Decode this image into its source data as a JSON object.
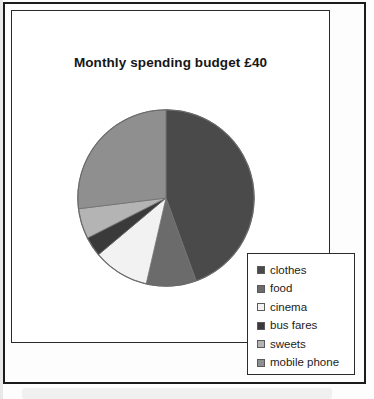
{
  "page": {
    "background_color": "#fdfdfd",
    "frame_color": "#1b1b1b"
  },
  "chart_data": {
    "type": "pie",
    "title": "Monthly spending budget £40",
    "xlabel": "",
    "ylabel": "",
    "legend_position": "bottom-right",
    "grid": false,
    "total_label": "£40",
    "categories": [
      "clothes",
      "food",
      "cinema",
      "bus fares",
      "sweets",
      "mobile phone"
    ],
    "values": [
      44.4,
      9.2,
      10.3,
      3.6,
      5.6,
      26.9
    ],
    "value_unit": "percent",
    "angles_deg": [
      160,
      33,
      37,
      13,
      20,
      97
    ],
    "colors": [
      "#4a4a4a",
      "#6b6b6b",
      "#f2f2f2",
      "#3a3a3a",
      "#b4b4b4",
      "#8f8f8f"
    ],
    "slices": [
      {
        "label": "clothes",
        "percent": 44.4,
        "angle_deg": 160,
        "color": "#4a4a4a"
      },
      {
        "label": "food",
        "percent": 9.2,
        "angle_deg": 33,
        "color": "#6b6b6b"
      },
      {
        "label": "cinema",
        "percent": 10.3,
        "angle_deg": 37,
        "color": "#f2f2f2"
      },
      {
        "label": "bus fares",
        "percent": 3.6,
        "angle_deg": 13,
        "color": "#3a3a3a"
      },
      {
        "label": "sweets",
        "percent": 5.6,
        "angle_deg": 20,
        "color": "#b4b4b4"
      },
      {
        "label": "mobile phone",
        "percent": 26.9,
        "angle_deg": 97,
        "color": "#8f8f8f"
      }
    ]
  },
  "legend": {
    "items": [
      {
        "label": "clothes",
        "color": "#4a4a4a"
      },
      {
        "label": "food",
        "color": "#6b6b6b"
      },
      {
        "label": "cinema",
        "color": "#f2f2f2"
      },
      {
        "label": "bus fares",
        "color": "#3a3a3a"
      },
      {
        "label": "sweets",
        "color": "#b4b4b4"
      },
      {
        "label": "mobile phone",
        "color": "#8f8f8f"
      }
    ]
  }
}
